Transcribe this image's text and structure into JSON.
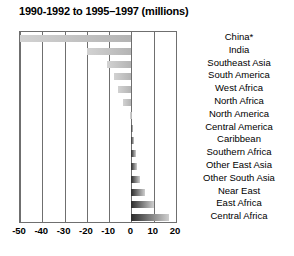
{
  "chart_data": {
    "type": "bar",
    "orientation": "horizontal",
    "title": "1990-1992 to 1995–1997 (millions)",
    "xlabel": "",
    "ylabel": "",
    "xlim": [
      -50,
      20
    ],
    "xticks": [
      -50,
      -40,
      -30,
      -20,
      -10,
      0,
      10,
      20
    ],
    "xtick_labels": [
      "-50",
      "-40",
      "-30",
      "-20",
      "-10",
      "0",
      "10",
      "20"
    ],
    "grid": true,
    "legend": "none",
    "categories": [
      "China*",
      "India",
      "Southeast Asia",
      "South America",
      "West Africa",
      "North Africa",
      "North America",
      "Central America",
      "Caribbean",
      "Southern Africa",
      "Other East Asia",
      "Other South Asia",
      "Near East",
      "East Africa",
      "Central Africa"
    ],
    "values": [
      -50,
      -20,
      -11,
      -8,
      -6,
      -4,
      -0.5,
      0.6,
      1.2,
      2,
      2.6,
      4,
      6,
      10,
      17
    ]
  },
  "colors": {
    "negative_bar_light": "#d2d2d2",
    "negative_bar_dark": "#b4b4b4",
    "positive_bar_dark": "#2b2b2b",
    "positive_bar_light": "#cfcfcf",
    "axis_line": "#6f6f6f",
    "text": "#000000",
    "background": "#ffffff"
  }
}
